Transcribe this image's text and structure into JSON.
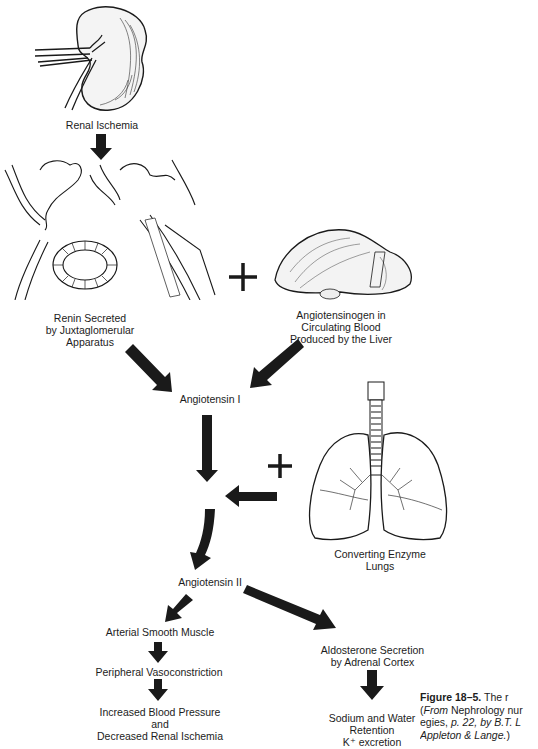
{
  "figure": {
    "nodes": {
      "renal_ischemia": "Renal Ischemia",
      "renin_line1": "Renin Secreted",
      "renin_line2": "by Juxtaglomerular",
      "renin_line3": "Apparatus",
      "angiotensinogen_line1": "Angiotensinogen in",
      "angiotensinogen_line2": "Circulating Blood",
      "angiotensinogen_line3": "Produced by the Liver",
      "angiotensin_1": "Angiotensin I",
      "converting_line1": "Converting Enzyme",
      "converting_line2": "Lungs",
      "angiotensin_2": "Angiotensin II",
      "arterial_smooth_muscle": "Arterial Smooth Muscle",
      "peripheral_vasoconstriction": "Peripheral Vasoconstriction",
      "increased_bp_line1": "Increased Blood Pressure",
      "increased_bp_line2": "and",
      "increased_bp_line3": "Decreased Renal Ischemia",
      "aldosterone_line1": "Aldosterone Secretion",
      "aldosterone_line2": "by Adrenal Cortex",
      "sodium_line1": "Sodium and Water",
      "sodium_line2": "Retention",
      "sodium_line3": "K⁺ excretion"
    },
    "plus_signs": [
      "+",
      "+"
    ],
    "illustrations": [
      "kidney-illustration",
      "juxtaglomerular-apparatus-illustration",
      "liver-illustration",
      "lungs-illustration"
    ],
    "caption": {
      "label": "Figure 18–5.",
      "line1_rest": " The r",
      "line2_italic": "From",
      "line2_rest": " Nephrology nur",
      "line3_a": "egies, ",
      "line3_b": "p. 22, by B.T. L",
      "line4": "Appleton & Lange.",
      "line4_close": ")",
      "line2_open": "("
    },
    "colors": {
      "ink": "#1a1a1a",
      "background": "#ffffff"
    }
  }
}
